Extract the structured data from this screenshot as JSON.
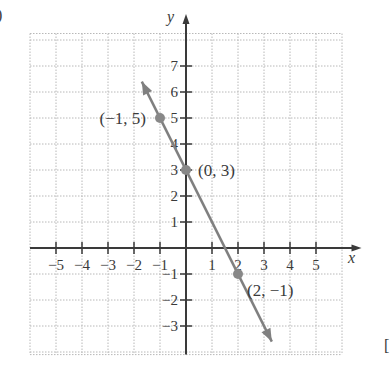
{
  "figure_marker": ")",
  "corner_marker": "[",
  "chart_data": {
    "type": "line",
    "title": "",
    "xlabel": "x",
    "ylabel": "y",
    "xlim": [
      -5,
      5
    ],
    "ylim": [
      -3,
      7
    ],
    "grid": true,
    "grid_style": "dotted",
    "x_ticks": [
      -5,
      -4,
      -3,
      -2,
      -1,
      1,
      2,
      3,
      4,
      5
    ],
    "x_tick_labels": [
      "−5",
      "−4",
      "−3",
      "−2",
      "−1",
      "1",
      "2",
      "3",
      "4",
      "5"
    ],
    "y_ticks": [
      -3,
      -2,
      -1,
      1,
      2,
      3,
      4,
      5,
      6,
      7
    ],
    "y_tick_labels": [
      "−3",
      "−2",
      "−1",
      "1",
      "2",
      "3",
      "4",
      "5",
      "6",
      "7"
    ],
    "line": {
      "equation": "y = -2x + 3",
      "slope": -2,
      "intercept": 3,
      "x_start": -1.7,
      "x_end": 3.3,
      "arrows": "both",
      "color": "#808080"
    },
    "points": [
      {
        "x": -1,
        "y": 5,
        "label": "(−1, 5)"
      },
      {
        "x": 0,
        "y": 3,
        "label": "(0, 3)"
      },
      {
        "x": 2,
        "y": -1,
        "label": "(2, −1)"
      }
    ],
    "point_color": "#888888",
    "axis_color": "#3a3a3a",
    "grid_color": "#b8b8b8"
  }
}
